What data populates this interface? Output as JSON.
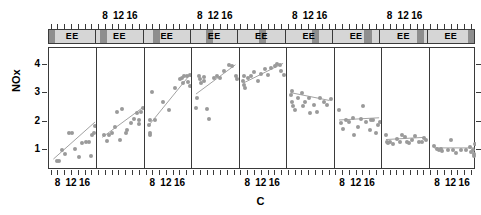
{
  "axes": {
    "ylabel": "NOx",
    "xlabel": "C",
    "y_ticks": [
      "1",
      "2",
      "3",
      "4"
    ],
    "y_tick_values": [
      1,
      2,
      3,
      4
    ],
    "x_ticks": [
      "8",
      "12",
      "16"
    ],
    "x_tick_values": [
      8,
      12,
      16
    ],
    "xlim": [
      5.2,
      19.2
    ],
    "ylim": [
      0.3,
      4.6
    ]
  },
  "strip": {
    "label": "EE",
    "count": 9
  },
  "chart_data": {
    "type": "scatter",
    "title": "",
    "xlabel": "C",
    "ylabel": "NOx",
    "xlim": [
      5.2,
      19.2
    ],
    "ylim": [
      0.3,
      4.6
    ],
    "xticks": [
      8,
      12,
      16
    ],
    "yticks": [
      1,
      2,
      3,
      4
    ],
    "grid": false,
    "legend": null,
    "conditioning": {
      "variable": "E",
      "strip_label": "EE",
      "n_panels": 9,
      "shade_fractions": [
        [
          0.0,
          0.13
        ],
        [
          0.09,
          0.24
        ],
        [
          0.2,
          0.36
        ],
        [
          0.32,
          0.48
        ],
        [
          0.44,
          0.6
        ],
        [
          0.56,
          0.72
        ],
        [
          0.68,
          0.84
        ],
        [
          0.79,
          0.94
        ],
        [
          0.88,
          1.0
        ]
      ]
    },
    "panels": [
      {
        "index": 1,
        "points": [
          [
            7.5,
            0.62
          ],
          [
            8.1,
            0.6
          ],
          [
            9.0,
            1.0
          ],
          [
            10.0,
            0.86
          ],
          [
            11.0,
            1.6
          ],
          [
            12.0,
            1.6
          ],
          [
            13.0,
            1.05
          ],
          [
            14.0,
            0.75
          ],
          [
            15.0,
            1.25
          ],
          [
            16.0,
            1.28
          ],
          [
            17.0,
            1.3
          ],
          [
            17.5,
            0.8
          ],
          [
            18.0,
            1.55
          ],
          [
            18.5,
            1.6
          ],
          [
            18.8,
            1.85
          ]
        ],
        "fit": [
          [
            6.5,
            0.62
          ],
          [
            18.8,
            1.95
          ]
        ]
      },
      {
        "index": 2,
        "points": [
          [
            7.0,
            1.55
          ],
          [
            8.0,
            1.32
          ],
          [
            8.6,
            1.52
          ],
          [
            9.5,
            1.6
          ],
          [
            10.5,
            1.82
          ],
          [
            11.0,
            2.35
          ],
          [
            12.0,
            1.35
          ],
          [
            12.5,
            2.45
          ],
          [
            13.5,
            1.62
          ],
          [
            14.0,
            1.7
          ],
          [
            15.0,
            1.95
          ],
          [
            16.0,
            2.1
          ],
          [
            17.0,
            2.3
          ],
          [
            17.4,
            2.05
          ],
          [
            17.6,
            1.92
          ],
          [
            18.2,
            2.35
          ],
          [
            18.6,
            2.5
          ]
        ],
        "fit": [
          [
            6.8,
            1.4
          ],
          [
            18.8,
            2.45
          ]
        ]
      },
      {
        "index": 3,
        "points": [
          [
            6.5,
            1.9
          ],
          [
            6.6,
            1.55
          ],
          [
            6.7,
            1.62
          ],
          [
            6.8,
            2.05
          ],
          [
            7.3,
            3.05
          ],
          [
            8.3,
            2.05
          ],
          [
            10.5,
            2.7
          ],
          [
            12.3,
            2.4
          ],
          [
            14.0,
            3.2
          ],
          [
            15.5,
            3.5
          ],
          [
            16.2,
            3.55
          ],
          [
            16.4,
            3.35
          ],
          [
            16.6,
            3.62
          ],
          [
            17.5,
            3.6
          ],
          [
            17.8,
            3.4
          ],
          [
            18.4,
            3.65
          ],
          [
            18.6,
            3.25
          ]
        ],
        "fit": [
          [
            6.5,
            1.85
          ],
          [
            18.6,
            3.62
          ]
        ]
      },
      {
        "index": 4,
        "points": [
          [
            6.4,
            2.5
          ],
          [
            6.6,
            2.85
          ],
          [
            7.3,
            3.6
          ],
          [
            7.5,
            3.52
          ],
          [
            7.7,
            3.38
          ],
          [
            8.5,
            3.58
          ],
          [
            8.7,
            3.45
          ],
          [
            9.5,
            2.45
          ],
          [
            10.0,
            2.1
          ],
          [
            11.5,
            3.55
          ],
          [
            12.5,
            3.6
          ],
          [
            13.5,
            3.55
          ],
          [
            14.5,
            3.8
          ],
          [
            16.0,
            4.0
          ],
          [
            17.0,
            3.95
          ],
          [
            18.0,
            3.62
          ],
          [
            18.3,
            3.5
          ]
        ],
        "fit": [
          [
            6.4,
            2.95
          ],
          [
            18.3,
            4.0
          ]
        ]
      },
      {
        "index": 5,
        "points": [
          [
            6.3,
            3.45
          ],
          [
            6.4,
            3.62
          ],
          [
            6.5,
            3.3
          ],
          [
            6.7,
            3.2
          ],
          [
            7.5,
            3.55
          ],
          [
            8.5,
            3.6
          ],
          [
            9.5,
            3.75
          ],
          [
            10.5,
            3.45
          ],
          [
            11.5,
            3.7
          ],
          [
            12.5,
            3.85
          ],
          [
            13.5,
            3.65
          ],
          [
            14.5,
            3.9
          ],
          [
            15.5,
            3.95
          ],
          [
            16.2,
            4.05
          ],
          [
            17.0,
            4.0
          ],
          [
            17.5,
            3.8
          ],
          [
            18.2,
            3.65
          ]
        ],
        "fit": [
          [
            6.3,
            3.35
          ],
          [
            18.2,
            4.05
          ]
        ]
      },
      {
        "index": 6,
        "points": [
          [
            6.3,
            2.95
          ],
          [
            6.5,
            3.1
          ],
          [
            6.6,
            2.7
          ],
          [
            6.8,
            2.55
          ],
          [
            7.5,
            2.4
          ],
          [
            8.5,
            2.85
          ],
          [
            9.5,
            3.0
          ],
          [
            10.0,
            2.55
          ],
          [
            10.5,
            2.7
          ],
          [
            11.5,
            2.85
          ],
          [
            12.0,
            2.3
          ],
          [
            13.0,
            2.6
          ],
          [
            14.0,
            2.35
          ],
          [
            15.0,
            2.85
          ],
          [
            16.0,
            2.7
          ],
          [
            17.0,
            2.6
          ],
          [
            18.0,
            2.8
          ]
        ],
        "fit": [
          [
            6.3,
            3.0
          ],
          [
            18.0,
            2.72
          ]
        ]
      },
      {
        "index": 7,
        "points": [
          [
            6.5,
            2.4
          ],
          [
            7.0,
            1.95
          ],
          [
            7.8,
            1.75
          ],
          [
            8.5,
            2.05
          ],
          [
            9.5,
            2.0
          ],
          [
            10.5,
            2.15
          ],
          [
            11.0,
            1.55
          ],
          [
            12.0,
            1.8
          ],
          [
            13.0,
            2.1
          ],
          [
            13.5,
            2.55
          ],
          [
            14.5,
            2.0
          ],
          [
            15.5,
            1.7
          ],
          [
            16.0,
            2.05
          ],
          [
            16.5,
            2.05
          ],
          [
            17.5,
            1.6
          ],
          [
            18.0,
            1.9
          ],
          [
            18.5,
            2.0
          ]
        ],
        "fit": [
          [
            6.4,
            2.02
          ],
          [
            18.5,
            2.1
          ]
        ]
      },
      {
        "index": 8,
        "points": [
          [
            6.4,
            1.55
          ],
          [
            6.6,
            1.3
          ],
          [
            7.0,
            1.25
          ],
          [
            7.5,
            1.3
          ],
          [
            8.5,
            1.2
          ],
          [
            9.5,
            1.4
          ],
          [
            10.5,
            1.3
          ],
          [
            11.0,
            1.55
          ],
          [
            12.0,
            1.45
          ],
          [
            12.5,
            1.28
          ],
          [
            13.0,
            1.25
          ],
          [
            14.0,
            1.35
          ],
          [
            15.0,
            1.5
          ],
          [
            16.0,
            1.3
          ],
          [
            17.0,
            1.28
          ],
          [
            17.5,
            1.42
          ],
          [
            18.2,
            1.35
          ]
        ],
        "fit": [
          [
            6.4,
            1.32
          ],
          [
            18.2,
            1.4
          ]
        ]
      },
      {
        "index": 9,
        "points": [
          [
            6.5,
            1.15
          ],
          [
            7.5,
            1.05
          ],
          [
            8.0,
            1.02
          ],
          [
            8.6,
            1.05
          ],
          [
            9.0,
            0.98
          ],
          [
            10.5,
            1.0
          ],
          [
            11.5,
            1.35
          ],
          [
            12.0,
            1.0
          ],
          [
            13.0,
            0.9
          ],
          [
            14.5,
            1.0
          ],
          [
            16.0,
            1.02
          ],
          [
            17.0,
            1.12
          ],
          [
            17.5,
            0.95
          ],
          [
            18.0,
            1.02
          ],
          [
            18.2,
            0.88
          ],
          [
            18.4,
            0.78
          ],
          [
            18.6,
            1.22
          ]
        ],
        "fit": [
          [
            6.4,
            1.02
          ],
          [
            18.6,
            1.02
          ]
        ]
      }
    ]
  },
  "style": {
    "point_color": "#9a9a9a",
    "line_color": "#a0a0a0",
    "frame_color": "#3a3a3a",
    "strip_bg": "#d6d6d6",
    "strip_shade": "#8e8e8e",
    "text_color": "#000000"
  }
}
